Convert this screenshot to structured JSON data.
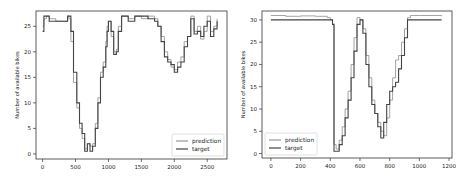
{
  "chart_data": [
    {
      "type": "line",
      "title": "",
      "xlabel": "",
      "ylabel": "Number of available bikes",
      "xlim": [
        -100,
        2800
      ],
      "ylim": [
        -1,
        28
      ],
      "xticks": [
        0,
        500,
        1000,
        1500,
        2000,
        2500
      ],
      "yticks": [
        0,
        5,
        10,
        15,
        20,
        25
      ],
      "grid": false,
      "legend_position": "lower right",
      "legend": [
        "prediction",
        "target"
      ],
      "series": [
        {
          "name": "prediction",
          "color": "#999999",
          "x": [
            0,
            20,
            60,
            100,
            200,
            300,
            350,
            380,
            400,
            430,
            470,
            520,
            560,
            600,
            640,
            680,
            720,
            760,
            800,
            840,
            880,
            920,
            960,
            980,
            1000,
            1040,
            1080,
            1120,
            1150,
            1200,
            1300,
            1400,
            1500,
            1600,
            1700,
            1750,
            1800,
            1850,
            1900,
            1950,
            2000,
            2050,
            2100,
            2150,
            2200,
            2250,
            2300,
            2350,
            2400,
            2450,
            2500,
            2550,
            2600,
            2650
          ],
          "y": [
            25,
            26.5,
            27,
            26.5,
            26,
            26,
            26,
            27,
            26.5,
            22,
            14,
            9,
            5,
            3,
            1,
            2,
            1.5,
            2,
            6,
            11,
            16,
            18,
            22,
            25,
            26,
            23,
            20,
            20.5,
            25,
            27,
            26.5,
            27,
            26.5,
            27,
            26.5,
            25,
            23,
            20,
            18.5,
            17,
            16.5,
            18,
            19,
            22,
            23,
            27,
            24,
            25,
            22.5,
            24,
            27,
            24,
            25,
            26.5
          ]
        },
        {
          "name": "target",
          "color": "#444444",
          "x": [
            0,
            20,
            60,
            100,
            200,
            300,
            350,
            380,
            400,
            430,
            470,
            520,
            560,
            600,
            640,
            680,
            720,
            760,
            800,
            840,
            880,
            920,
            960,
            980,
            1000,
            1040,
            1080,
            1120,
            1150,
            1200,
            1300,
            1400,
            1500,
            1600,
            1700,
            1750,
            1800,
            1850,
            1900,
            1950,
            2000,
            2050,
            2100,
            2150,
            2200,
            2250,
            2300,
            2350,
            2400,
            2450,
            2500,
            2550,
            2600,
            2650
          ],
          "y": [
            24,
            27,
            27,
            26,
            26,
            26,
            26,
            27,
            27,
            24,
            16,
            10,
            6,
            4,
            0.5,
            2,
            0.5,
            1.5,
            5,
            10,
            15,
            17,
            21,
            24,
            26,
            24,
            19.5,
            20,
            24,
            27,
            26,
            27,
            27,
            26.5,
            26,
            25,
            22,
            19,
            18,
            17.5,
            16,
            17,
            18,
            21,
            23,
            26.5,
            23.5,
            24,
            23,
            25,
            26,
            23,
            24.5,
            26
          ]
        }
      ]
    },
    {
      "type": "line",
      "title": "",
      "xlabel": "",
      "ylabel": "Number of available bikes",
      "xlim": [
        -60,
        1220
      ],
      "ylim": [
        -1,
        32
      ],
      "xticks": [
        0,
        200,
        400,
        600,
        800,
        1000,
        1200
      ],
      "yticks": [
        0,
        5,
        10,
        15,
        20,
        25,
        30
      ],
      "grid": false,
      "legend_position": "lower left",
      "legend": [
        "prediction",
        "target"
      ],
      "series": [
        {
          "name": "prediction",
          "color": "#999999",
          "x": [
            0,
            100,
            200,
            300,
            380,
            400,
            415,
            425,
            440,
            460,
            480,
            500,
            520,
            540,
            560,
            580,
            600,
            620,
            640,
            660,
            680,
            700,
            720,
            740,
            760,
            780,
            800,
            820,
            840,
            860,
            880,
            900,
            920,
            940,
            960,
            1000,
            1100,
            1150
          ],
          "y": [
            31,
            30.8,
            30.9,
            30.8,
            30.5,
            30,
            29,
            2,
            1,
            3,
            6,
            10,
            14,
            20,
            26,
            30.5,
            30,
            28,
            22,
            17,
            12,
            9,
            7,
            5,
            4,
            8,
            12,
            17,
            21,
            22,
            25,
            28,
            30.5,
            31,
            31,
            31,
            31,
            30.8
          ]
        },
        {
          "name": "target",
          "color": "#444444",
          "x": [
            0,
            100,
            200,
            300,
            380,
            400,
            415,
            425,
            440,
            460,
            480,
            500,
            520,
            540,
            560,
            580,
            600,
            620,
            640,
            660,
            680,
            700,
            720,
            740,
            760,
            780,
            800,
            820,
            840,
            860,
            880,
            900,
            920,
            940,
            960,
            1000,
            1100,
            1150
          ],
          "y": [
            30,
            30,
            30,
            30,
            30,
            30,
            29,
            0.5,
            0.5,
            2,
            4,
            8,
            12,
            17,
            23,
            29,
            30,
            27,
            20,
            15,
            11,
            9,
            6,
            3.5,
            7,
            11,
            14,
            15,
            16,
            19,
            22,
            26,
            30,
            30,
            30,
            30,
            30,
            30
          ]
        }
      ]
    }
  ]
}
